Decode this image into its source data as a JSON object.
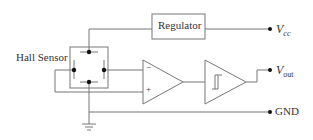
{
  "labels": {
    "hall_sensor": "Hall Sensor",
    "regulator": "Regulator",
    "vcc_main": "V",
    "vcc_sub": "cc",
    "vout_main": "V",
    "vout_sub": "out",
    "gnd": "GND",
    "minus": "−",
    "plus": "+"
  },
  "colors": {
    "line": "#777777",
    "dot": "#111111",
    "text": "#333333"
  }
}
